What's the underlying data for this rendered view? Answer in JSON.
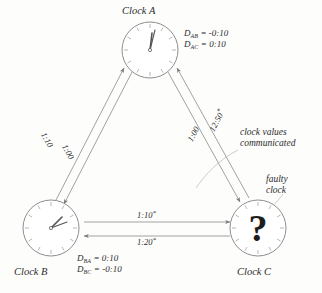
{
  "figure": {
    "kind": "clock-synchronization-diagram",
    "background_color": "#fdfdfc",
    "ink_color": "#6f6f6f",
    "text_color": "#2c2c2c"
  },
  "clocks": [
    {
      "id": "A",
      "title": "Clock A",
      "face": "analog-clock-face",
      "reading": "12:00",
      "hour_hand_angle_deg": 6,
      "minute_hand_angle_deg": 12,
      "faulty": false
    },
    {
      "id": "B",
      "title": "Clock B",
      "face": "analog-clock-face",
      "reading": "1:10",
      "hour_hand_angle_deg": 38,
      "minute_hand_angle_deg": 62,
      "faulty": false
    },
    {
      "id": "C",
      "title": "Clock C",
      "face": "analog-clock-face",
      "reading": "?",
      "glyph": "?",
      "faulty": true
    }
  ],
  "offsets": {
    "clock_a": [
      {
        "symbol": "D",
        "subscript": "AB",
        "equals": "=",
        "value": "-0:10"
      },
      {
        "symbol": "D",
        "subscript": "AC",
        "equals": "=",
        "value": "0:10"
      }
    ],
    "clock_b": [
      {
        "symbol": "D",
        "subscript": "BA",
        "equals": "=",
        "value": "0:10"
      },
      {
        "symbol": "D",
        "subscript": "BC",
        "equals": "=",
        "value": "-0:10"
      }
    ]
  },
  "edges": [
    {
      "id": "b-to-a",
      "from": "B",
      "to": "A",
      "label": "1:10",
      "starred": false
    },
    {
      "id": "a-to-b",
      "from": "A",
      "to": "B",
      "label": "1:00",
      "starred": false
    },
    {
      "id": "a-to-c",
      "from": "A",
      "to": "C",
      "label": "1:00",
      "starred": false
    },
    {
      "id": "c-to-a",
      "from": "C",
      "to": "A",
      "label": "12:50",
      "starred": true
    },
    {
      "id": "b-to-c",
      "from": "B",
      "to": "C",
      "label": "1:10",
      "starred": true
    },
    {
      "id": "c-to-b",
      "from": "C",
      "to": "B",
      "label": "1:20",
      "starred": true
    }
  ],
  "annotations": [
    {
      "id": "communicated",
      "line1": "clock values",
      "line2": "communicated"
    },
    {
      "id": "faulty",
      "line1": "faulty",
      "line2": "clock"
    }
  ],
  "star_symbol": "*"
}
